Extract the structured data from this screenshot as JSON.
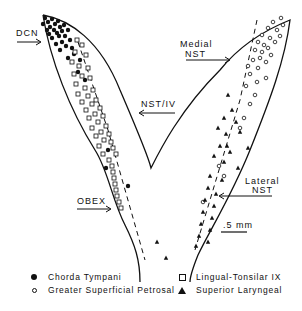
{
  "labels": {
    "dcn": "DCN",
    "nst_iv": "NST/IV",
    "obex": "OBEX",
    "medial_line1": "Medial",
    "medial_line2": "NST",
    "lateral_line1": "Lateral",
    "lateral_line2": "NST",
    "scale": ".5 mm"
  },
  "legend": [
    {
      "symbol": "filled-circle",
      "label": "Chorda Tympani"
    },
    {
      "symbol": "open-circle",
      "label": "Greater Superficial Petrosal"
    },
    {
      "symbol": "open-square",
      "label": "Lingual-Tonsilar IX"
    },
    {
      "symbol": "filled-triangle",
      "label": "Superior Laryngeal"
    }
  ],
  "markers": {
    "chorda_tympani": [
      [
        45,
        18
      ],
      [
        48,
        22
      ],
      [
        52,
        19
      ],
      [
        55,
        24
      ],
      [
        50,
        27
      ],
      [
        58,
        21
      ],
      [
        60,
        27
      ],
      [
        54,
        30
      ],
      [
        47,
        30
      ],
      [
        57,
        33
      ],
      [
        62,
        31
      ],
      [
        64,
        25
      ],
      [
        43,
        24
      ],
      [
        49,
        34
      ],
      [
        59,
        36
      ],
      [
        65,
        36
      ],
      [
        52,
        38
      ],
      [
        68,
        30
      ],
      [
        70,
        40
      ],
      [
        62,
        42
      ],
      [
        56,
        44
      ],
      [
        66,
        46
      ],
      [
        72,
        48
      ],
      [
        60,
        50
      ],
      [
        74,
        54
      ],
      [
        68,
        58
      ],
      [
        80,
        60
      ],
      [
        78,
        72
      ],
      [
        85,
        80
      ],
      [
        108,
        150
      ],
      [
        106,
        168
      ],
      [
        128,
        186
      ]
    ],
    "greater_superficial_petrosal": [
      [
        268,
        28
      ],
      [
        273,
        22
      ],
      [
        277,
        30
      ],
      [
        262,
        35
      ],
      [
        270,
        38
      ],
      [
        275,
        42
      ],
      [
        264,
        45
      ],
      [
        258,
        42
      ],
      [
        255,
        50
      ],
      [
        262,
        52
      ],
      [
        268,
        48
      ],
      [
        271,
        55
      ],
      [
        260,
        58
      ],
      [
        253,
        60
      ],
      [
        266,
        62
      ],
      [
        248,
        66
      ],
      [
        258,
        68
      ],
      [
        250,
        74
      ],
      [
        257,
        82
      ],
      [
        266,
        78
      ],
      [
        246,
        86
      ],
      [
        255,
        95
      ],
      [
        250,
        104
      ],
      [
        244,
        118
      ],
      [
        240,
        128
      ],
      [
        219,
        166
      ],
      [
        224,
        176
      ],
      [
        203,
        202
      ],
      [
        281,
        18
      ],
      [
        283,
        25
      ],
      [
        280,
        36
      ]
    ],
    "lingual_tonsilar": [
      [
        77,
        40
      ],
      [
        82,
        45
      ],
      [
        75,
        52
      ],
      [
        86,
        55
      ],
      [
        72,
        62
      ],
      [
        79,
        66
      ],
      [
        88,
        68
      ],
      [
        74,
        74
      ],
      [
        82,
        76
      ],
      [
        90,
        78
      ],
      [
        76,
        84
      ],
      [
        85,
        88
      ],
      [
        93,
        90
      ],
      [
        78,
        94
      ],
      [
        88,
        96
      ],
      [
        96,
        100
      ],
      [
        82,
        102
      ],
      [
        92,
        104
      ],
      [
        100,
        108
      ],
      [
        86,
        110
      ],
      [
        95,
        114
      ],
      [
        103,
        116
      ],
      [
        89,
        118
      ],
      [
        98,
        122
      ],
      [
        106,
        126
      ],
      [
        92,
        128
      ],
      [
        101,
        132
      ],
      [
        109,
        134
      ],
      [
        96,
        136
      ],
      [
        104,
        140
      ],
      [
        111,
        142
      ],
      [
        99,
        146
      ],
      [
        113,
        148
      ],
      [
        103,
        154
      ],
      [
        116,
        154
      ],
      [
        109,
        160
      ],
      [
        112,
        166
      ],
      [
        113,
        172
      ],
      [
        114,
        178
      ],
      [
        115,
        184
      ],
      [
        116,
        190
      ],
      [
        117,
        196
      ],
      [
        119,
        202
      ],
      [
        121,
        208
      ]
    ],
    "superior_laryngeal": [
      [
        228,
        95
      ],
      [
        232,
        110
      ],
      [
        224,
        118
      ],
      [
        236,
        122
      ],
      [
        218,
        128
      ],
      [
        226,
        134
      ],
      [
        240,
        132
      ],
      [
        220,
        146
      ],
      [
        230,
        152
      ],
      [
        248,
        148
      ],
      [
        214,
        156
      ],
      [
        224,
        162
      ],
      [
        238,
        168
      ],
      [
        210,
        176
      ],
      [
        222,
        180
      ],
      [
        208,
        188
      ],
      [
        216,
        194
      ],
      [
        205,
        200
      ],
      [
        214,
        206
      ],
      [
        203,
        212
      ],
      [
        212,
        218
      ],
      [
        201,
        224
      ],
      [
        210,
        230
      ],
      [
        199,
        236
      ],
      [
        208,
        242
      ],
      [
        196,
        246
      ],
      [
        157,
        242
      ],
      [
        166,
        258
      ],
      [
        227,
        146
      ]
    ]
  }
}
